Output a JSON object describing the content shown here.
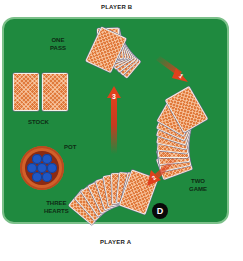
{
  "players": {
    "top": "PLAYER B",
    "right": "PLAYER C",
    "bottom": "PLAYER A"
  },
  "table": {
    "felt_color": "#1f8a3f",
    "border_color": "#7cc08a"
  },
  "labels": {
    "player_b_bid": [
      "ONE",
      "PASS"
    ],
    "stock": "STOCK",
    "pot": "POT",
    "player_a_bid": [
      "THREE",
      "HEARTS"
    ],
    "player_c_bid": [
      "TWO",
      "GAME"
    ]
  },
  "arrows": [
    {
      "number": "1",
      "from": "PLAYER B",
      "to": "PLAYER C"
    },
    {
      "number": "2",
      "from": "PLAYER C",
      "to": "PLAYER A"
    },
    {
      "number": "3",
      "from": "PLAYER A",
      "to": "PLAYER B"
    }
  ],
  "dealer_button": "D",
  "stock_cards": 2,
  "hand_card_count": 10,
  "colors": {
    "card_back": "#e07a3c",
    "arrow": "#d8321c",
    "chip": "#1f57c4",
    "pot": "#d2602a"
  }
}
